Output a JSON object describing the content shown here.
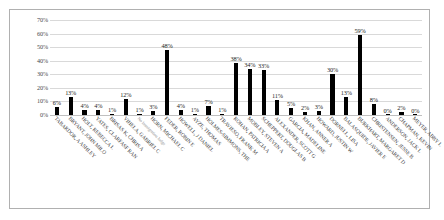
{
  "chart_data": {
    "type": "bar",
    "title": "",
    "xlabel": "",
    "ylabel": "",
    "ylim": [
      0,
      70
    ],
    "grid": true,
    "legend": "none",
    "ytick_labels": [
      "70%",
      "60%",
      "50%",
      "40%",
      "30%",
      "20%",
      "10%",
      "0%"
    ],
    "yticks": [
      70,
      60,
      50,
      40,
      30,
      20,
      10,
      0
    ],
    "categories": [
      "TABARDOR, A ASHLEY",
      "BRYANT, JOHN MILO",
      "HOLT, REBECCA L",
      "YATES, CLARFASF RAN",
      "BRISAS K, CHRIS A",
      "VIHELA, GABRIEL C",
      "No Immigration Judge",
      "HORN, MICHAEL C",
      "FEDER, ROBIN E",
      "HOWELL, J DANIEL",
      "AYZE, THOMAS",
      "HOLMES-SIMMONS, THE",
      "TRAVIESO, FRANK M",
      "ROHAN, PATRICIA A",
      "MOBLEY, STEVEN A",
      "SCHEPPERT, DOUGLAS B",
      "ALEXANDER, SCOTT G",
      "GARCIA, MADELINE",
      "KHAN, ANNER A",
      "HOWARD, JUSTIN W",
      "DORNELL, LISA",
      "BALASQUIDE, JAVIER E",
      "BURKHART, MARGARET D",
      "CHRISTENSEN, JESSE B",
      "ANDERSON, JACK L",
      "CHAPMAN, KEVIN",
      "MEYER, ABBY L"
    ],
    "values": [
      6,
      13,
      4,
      4,
      1,
      12,
      1,
      3,
      48,
      4,
      1,
      7,
      1,
      38,
      34,
      33,
      11,
      5,
      2,
      3,
      30,
      13,
      59,
      8,
      0,
      2,
      0
    ],
    "value_labels": [
      "6%",
      "13%",
      "4%",
      "4%",
      "1%",
      "12%",
      "1%",
      "3%",
      "48%",
      "4%",
      "1%",
      "7%",
      "1%",
      "38%",
      "34%",
      "33%",
      "11%",
      "5%",
      "2%",
      "3%",
      "30%",
      "13%",
      "59%",
      "8%",
      "0%",
      "2%",
      "0%"
    ],
    "bar_color": "#000000",
    "grid_color": "#d9d9d9",
    "border_color": "#b0b0b0"
  }
}
